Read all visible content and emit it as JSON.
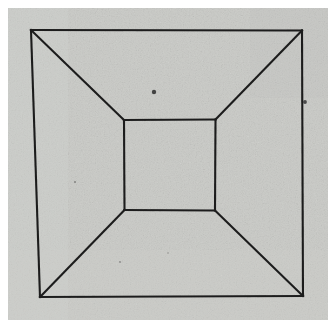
{
  "figure": {
    "name": "truncated-pyramid-illusion",
    "title": "Reversible perspective figure",
    "medium": "halftone print scan on grey paper",
    "canvas": {
      "width": 336,
      "height": 328
    },
    "colors": {
      "page_background": "#ffffff",
      "paper_fill": "#c9cac6",
      "paper_fill_light": "#d2d3cf",
      "paper_fill_dark": "#bdbeba",
      "ink": "#1c1c1c",
      "speck": "#2a2a2a"
    },
    "paper": {
      "x": 8,
      "y": 8,
      "width": 320,
      "height": 312
    },
    "line_width": 2.1,
    "outer_square": {
      "label": "outer-square",
      "top_left": {
        "x": 31,
        "y": 30
      },
      "top_right": {
        "x": 302,
        "y": 30.5
      },
      "bottom_right": {
        "x": 303,
        "y": 296
      },
      "bottom_left": {
        "x": 40,
        "y": 297
      }
    },
    "inner_square": {
      "label": "inner-square",
      "top_left": {
        "x": 124,
        "y": 120
      },
      "top_right": {
        "x": 215.5,
        "y": 119.5
      },
      "bottom_right": {
        "x": 215,
        "y": 210.5
      },
      "bottom_left": {
        "x": 124.5,
        "y": 210
      }
    },
    "diagonals": [
      {
        "label": "diagonal-top-left",
        "from": {
          "x": 31,
          "y": 30
        },
        "to": {
          "x": 124,
          "y": 120
        }
      },
      {
        "label": "diagonal-top-right",
        "from": {
          "x": 302,
          "y": 30.5
        },
        "to": {
          "x": 215.5,
          "y": 119.5
        }
      },
      {
        "label": "diagonal-bottom-right",
        "from": {
          "x": 303,
          "y": 296
        },
        "to": {
          "x": 215,
          "y": 210.5
        }
      },
      {
        "label": "diagonal-bottom-left",
        "from": {
          "x": 40,
          "y": 297
        },
        "to": {
          "x": 124.5,
          "y": 210
        }
      }
    ],
    "specks": [
      {
        "label": "print-speck-upper-middle",
        "x": 154,
        "y": 92,
        "r": 2.2
      },
      {
        "label": "print-speck-upper-right",
        "x": 305,
        "y": 102,
        "r": 1.9
      },
      {
        "label": "print-speck-left-mid",
        "x": 75,
        "y": 182,
        "r": 1.0
      },
      {
        "label": "print-speck-lower-left",
        "x": 120,
        "y": 262,
        "r": 0.9
      },
      {
        "label": "print-speck-inner-low",
        "x": 168,
        "y": 253,
        "r": 0.8
      }
    ]
  }
}
